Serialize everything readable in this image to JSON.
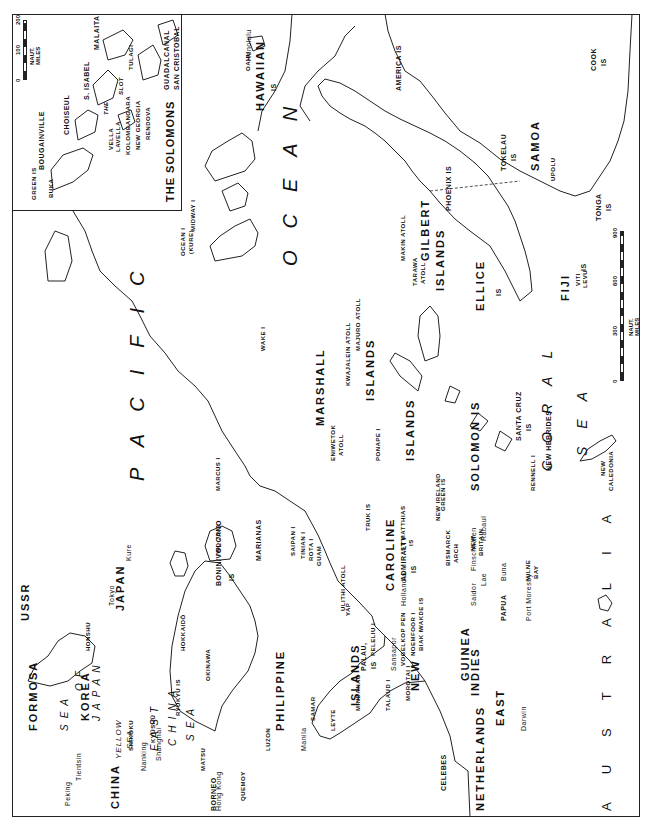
{
  "map": {
    "title": "Pacific Ocean theater map",
    "orientation": "rotated 90° counter-clockwise (north points left)",
    "oceans": {
      "pacific": "PACIFIC",
      "ocean": "OCEAN"
    },
    "seas": {
      "sea_of_japan": [
        "SEA",
        "OF",
        "JAPAN"
      ],
      "yellow_sea": [
        "YELLOW",
        "SEA"
      ],
      "east_china_sea": [
        "EAST",
        "CHINA",
        "SEA"
      ],
      "coral_sea": [
        "CORAL",
        "SEA"
      ]
    },
    "countries": {
      "ussr": "USSR",
      "korea": "KOREA",
      "china": "CHINA",
      "japan": "JAPAN",
      "australia": "AUSTRALIA",
      "borneo": "BORNEO",
      "celebes": "CELEBES",
      "netherlands_east_indies": [
        "NETHERLANDS",
        "EAST",
        "INDIES"
      ],
      "formosa": "FORMOSA",
      "philippine": [
        "PHILIPPINE",
        "ISLANDS"
      ],
      "new_guinea": [
        "NEW",
        "GUINEA"
      ],
      "papua": "PAPUA"
    },
    "japan_parts": {
      "hokkaido": "HOKKAIDŌ",
      "honshu": "HONSHU",
      "shikoku": "SHIKOKU",
      "kyushu": "KYŪSHŪ"
    },
    "cities": {
      "peking": "Peking",
      "tientsin": "Tientsin",
      "nanking": "Nanking",
      "shanghai": "Shanghai",
      "hong_kong": "Hong Kong",
      "tokyo": "Tokyo",
      "kure": "Kure",
      "manila": "Manila",
      "hollandia": "Hollandia",
      "saidor": "Saidor",
      "finschhafen": "Finschhafen",
      "lae": "Lae",
      "buna": "Buna",
      "port_moresby": "Port Moresby",
      "rabaul": "Rabaul",
      "darwin": "Darwin",
      "honolulu": "Honolulu",
      "sansapor": "Sansapor"
    },
    "islands": {
      "ryukyu": "RYUKYU IS",
      "okinawa": "OKINAWA",
      "matsu": "MATSU",
      "quemoy": "QUEMOY",
      "luzon": "LUZON",
      "samar": "SAMAR",
      "leyte": "LEYTE",
      "mindanao": "MINDANAO",
      "bonin_volcano": [
        "BONIN/VOLCANO",
        "IS"
      ],
      "iwo_jima": "IWO JIMA",
      "marcus": "MARCUS I",
      "marianas": "MARIANAS",
      "saipan": "SAIPAN I",
      "tinian": "TINIAN I",
      "rota": "ROTA I",
      "guam": "GUAM",
      "ulithi": "ULITHI ATOLL",
      "yap": "YAP",
      "palau": [
        "PALAU,",
        "IS"
      ],
      "peleliu": "PELELIU I",
      "talaud": "TALAUD I",
      "morotai": "MOROTAI I",
      "vogelkop": "VOGELKOP PEN",
      "noemfoor": "NOEMFOOR I",
      "biak": "BIAK I",
      "wakde": "WAKDE IS",
      "caroline": [
        "CAROLINE",
        "ISLANDS"
      ],
      "truk": "TRUK IS",
      "ponape": "PONAPE I",
      "eniwetok": [
        "ENIWETOK",
        "ATOLL"
      ],
      "marshall": [
        "MARSHALL",
        "ISLANDS"
      ],
      "kwajalein": "KWAJALEIN ATOLL",
      "majuro": "MAJURO ATOLL",
      "wake": "WAKE I",
      "admiralty": [
        "ADMIRALTY",
        "IS"
      ],
      "st_matthias": [
        "ST MATTHIAS",
        "IS"
      ],
      "bismarck": [
        "BISMARCK",
        "ARCH"
      ],
      "new_ireland": "NEW IRELAND",
      "green": "GREEN IS",
      "new_britain": [
        "NEW",
        "BRITAIN"
      ],
      "milne_bay": [
        "MILNE",
        "BAY"
      ],
      "solomon": "SOLOMON IS",
      "rennell": "RENNELL I",
      "santa_cruz": [
        "SANTA CRUZ",
        "IS"
      ],
      "new_hebrides": "NEW HEBRIDES",
      "new_caledonia": [
        "NEW",
        "CALEDONIA"
      ],
      "gilbert": [
        "GILBERT",
        "ISLANDS"
      ],
      "makin": "MAKIN ATOLL",
      "tarawa": [
        "TARAWA",
        "ATOLL"
      ],
      "ellice": [
        "ELLICE",
        "IS"
      ],
      "fiji": [
        "FIJI",
        "IS"
      ],
      "viti_levu": [
        "VITI",
        "LEVU"
      ],
      "phoenix": "PHOENIX IS",
      "tokelau": [
        "TOKELAU",
        "IS"
      ],
      "samoa": "SAMOA",
      "upolu": "UPOLU",
      "tonga": [
        "TONGA",
        "IS"
      ],
      "cook": [
        "COOK",
        "IS"
      ],
      "america": "AMERICA IS",
      "hawaiian": [
        "HAWAIIAN",
        "IS"
      ],
      "oahu": "OAHU",
      "midway": "MIDWAY I",
      "ocean_kure": [
        "OCEAN I",
        "(KURE)"
      ]
    },
    "scale": {
      "ticks": [
        "0",
        "300",
        "600",
        "900"
      ],
      "unit": "NAUT. MILES"
    },
    "inset": {
      "title": "THE SOLOMONS",
      "labels": {
        "green_is": "GREEN IS",
        "buka": "BUKA",
        "bougainville": "BOUGAINVILLE",
        "choiseul": "CHOISEUL",
        "vella_lavella": [
          "VELLA",
          "LAVELLA"
        ],
        "kolombangara": "KOLOMBANGARA",
        "new_georgia": "NEW GEORGIA",
        "rendova": "RENDOVA",
        "the_slot": [
          "THE",
          "SLOT"
        ],
        "s_isabel": "S. ISABEL",
        "tulagi": "TULAGI",
        "malaita": "MALAITA",
        "guadalcanal": "GUADALCANAL",
        "san_cristobal": "SAN CRISTOBAL"
      },
      "scale": {
        "ticks": [
          "0",
          "100",
          "200"
        ],
        "unit": "NAUT. MILES"
      }
    }
  }
}
